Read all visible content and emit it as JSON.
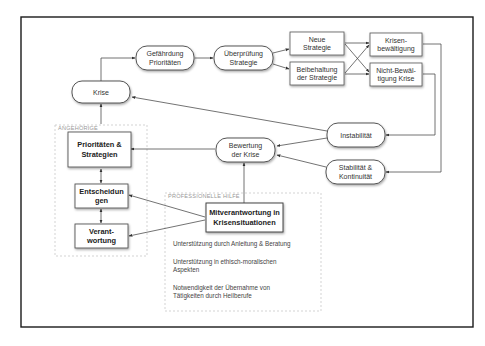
{
  "diagram": {
    "title": "",
    "nodes": {
      "gefaehrdung": {
        "line1": "Gefährdung",
        "line2": "Prioritäten",
        "shape": "pill"
      },
      "ueberpruefung": {
        "line1": "Überprüfung",
        "line2": "Strategie",
        "shape": "pill"
      },
      "neue_strategie": {
        "line1": "Neue",
        "line2": "Strategie",
        "shape": "box"
      },
      "beibehaltung": {
        "line1": "Beibehaltung",
        "line2": "der Strategie",
        "shape": "box"
      },
      "krisenbewaeltigung": {
        "line1": "Krisen-",
        "line2": "bewältigung",
        "shape": "box"
      },
      "nicht_bewaeltigung": {
        "line1": "Nicht-Bewäl-",
        "line2": "tigung Krise",
        "shape": "box"
      },
      "krise": {
        "line1": "Krise",
        "shape": "pill"
      },
      "instabilitaet": {
        "line1": "Instabilität",
        "shape": "pill"
      },
      "stabilitaet": {
        "line1": "Stabilität &",
        "line2": "Kontinuität",
        "shape": "pill"
      },
      "bewertung": {
        "line1": "Bewertung",
        "line2": "der Krise",
        "shape": "pill"
      },
      "prioritaeten": {
        "line1": "Prioritäten &",
        "line2": "Strategien",
        "shape": "box"
      },
      "entscheidungen": {
        "line1": "Entscheidun",
        "line2": "gen",
        "shape": "box"
      },
      "verantwortung": {
        "line1": "Verant-",
        "line2": "wortung",
        "shape": "box"
      },
      "mitverantwortung": {
        "line1": "Mitverantwortung in",
        "line2": "Krisensituationen",
        "shape": "box"
      }
    },
    "groups": {
      "angehoerige": {
        "label": "ANGEHÖRIGE"
      },
      "professionelle_hilfe": {
        "label": "PROFESSIONELLE HILFE",
        "notes": [
          {
            "line1": "Unterstützung durch Anleitung & Beratung"
          },
          {
            "line1": "Unterstützung in ethisch-moralischen",
            "line2": "Aspekten"
          },
          {
            "line1": "Notwendigkeit der Übernahme von",
            "line2": "Tätigkeiten durch Heilberufe"
          }
        ]
      }
    },
    "edges": [
      {
        "from": "krise",
        "to": "gefaehrdung"
      },
      {
        "from": "gefaehrdung",
        "to": "ueberpruefung"
      },
      {
        "from": "ueberpruefung",
        "to": "neue_strategie"
      },
      {
        "from": "ueberpruefung",
        "to": "beibehaltung"
      },
      {
        "from": "neue_strategie",
        "to": "krisenbewaeltigung"
      },
      {
        "from": "neue_strategie",
        "to": "nicht_bewaeltigung"
      },
      {
        "from": "beibehaltung",
        "to": "krisenbewaeltigung"
      },
      {
        "from": "beibehaltung",
        "to": "nicht_bewaeltigung"
      },
      {
        "from": "krisenbewaeltigung",
        "to": "stabilitaet"
      },
      {
        "from": "nicht_bewaeltigung",
        "to": "instabilitaet"
      },
      {
        "from": "instabilitaet",
        "to": "krise"
      },
      {
        "from": "instabilitaet",
        "to": "bewertung"
      },
      {
        "from": "stabilitaet",
        "to": "bewertung"
      },
      {
        "from": "bewertung",
        "to": "prioritaeten"
      },
      {
        "from": "mitverantwortung",
        "to": "bewertung"
      },
      {
        "from": "mitverantwortung",
        "to": "entscheidungen"
      },
      {
        "from": "mitverantwortung",
        "to": "verantwortung"
      },
      {
        "from": "angehoerige",
        "to": "krise"
      },
      {
        "from": "prioritaeten",
        "to": "entscheidungen",
        "bidirectional": true
      },
      {
        "from": "entscheidungen",
        "to": "verantwortung",
        "bidirectional": true
      }
    ],
    "colors": {
      "frame": "#1a1a1a",
      "node_border": "#555555",
      "arrow": "#444444",
      "group_border": "#c8c8c8",
      "text": "#333333"
    }
  }
}
